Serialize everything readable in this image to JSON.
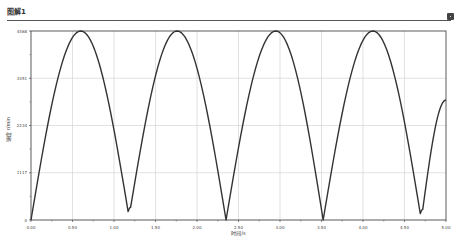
{
  "window": {
    "title": "图解1",
    "close_icon": "close-icon"
  },
  "chart_data": {
    "type": "line",
    "title": "图解1",
    "xlabel": "时间/s",
    "ylabel": "速度 r/min",
    "xlim": [
      0,
      5.0
    ],
    "ylim": [
      0,
      4468
    ],
    "x_ticks": [
      "0.00",
      "0.50",
      "1.00",
      "1.50",
      "2.00",
      "2.50",
      "3.00",
      "3.50",
      "4.00",
      "4.50",
      "5.00"
    ],
    "y_ticks": [
      "0",
      "1117",
      "2234",
      "3351",
      "4468"
    ],
    "grid": true,
    "legend": null,
    "series": [
      {
        "name": "速度",
        "color": "#333333",
        "x": [
          0.0,
          0.6,
          1.17,
          1.2,
          1.76,
          2.35,
          2.95,
          3.52,
          4.12,
          4.69,
          4.72,
          5.0
        ],
        "y": [
          0,
          4468,
          200,
          300,
          4468,
          0,
          4468,
          0,
          4468,
          150,
          250,
          2837
        ]
      }
    ]
  }
}
